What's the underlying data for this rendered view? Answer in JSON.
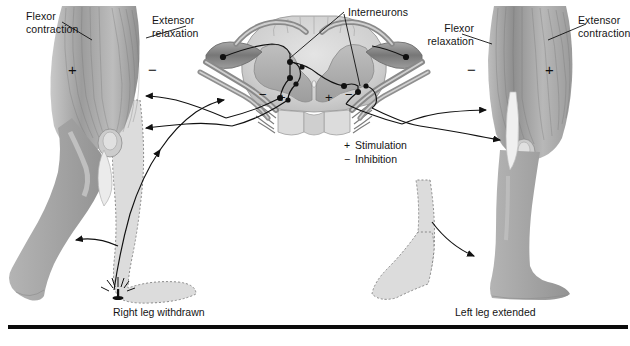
{
  "figure": {
    "background_color": "#ffffff",
    "rule_color": "#0b0b0b"
  },
  "labels": {
    "left_flexor": "Flexor\ncontraction",
    "left_extensor": "Extensor\nrelaxation",
    "interneurons": "Interneurons",
    "right_flexor": "Flexor\nrelaxation",
    "right_extensor": "Extensor\ncontraction"
  },
  "signs": {
    "left_leg_flexor": "+",
    "left_leg_extensor": "−",
    "cord_left_minus": "−",
    "cord_left_plus": "+",
    "cord_right_plus": "+",
    "cord_right_minus": "−",
    "right_leg_flexor": "−",
    "right_leg_extensor": "+"
  },
  "legend": {
    "stimulation_symbol": "+",
    "stimulation_label": "Stimulation",
    "inhibition_symbol": "−",
    "inhibition_label": "Inhibition"
  },
  "captions": {
    "left": "Right leg withdrawn",
    "right": "Left leg extended"
  },
  "anatomy": {
    "spinal_cord": "spinal-cord-cross-section",
    "gray_matter": "butterfly-gray-matter",
    "dorsal_root_ganglion_left": "dorsal-root-ganglion-left",
    "dorsal_root_ganglion_right": "dorsal-root-ganglion-right",
    "stimulus": "tack-pin-stimulus",
    "left_limb": "right-leg-withdrawn-limb",
    "right_limb": "left-leg-extended-limb",
    "ghost_left": "dashed-outline-previous-position-left",
    "ghost_right": "dashed-outline-previous-position-right"
  },
  "colors": {
    "muscle_dark": "#8e8e8e",
    "muscle_mid": "#b5b5b5",
    "muscle_light": "#d8d8d8",
    "limb_fill": "#a9a9a9",
    "ghost_fill": "#dcdcdc",
    "cord_white_matter": "#d2d2d2",
    "cord_gray_matter": "#b0b0b0",
    "nerve_dark": "#7a7a7a",
    "ink": "#111111"
  }
}
